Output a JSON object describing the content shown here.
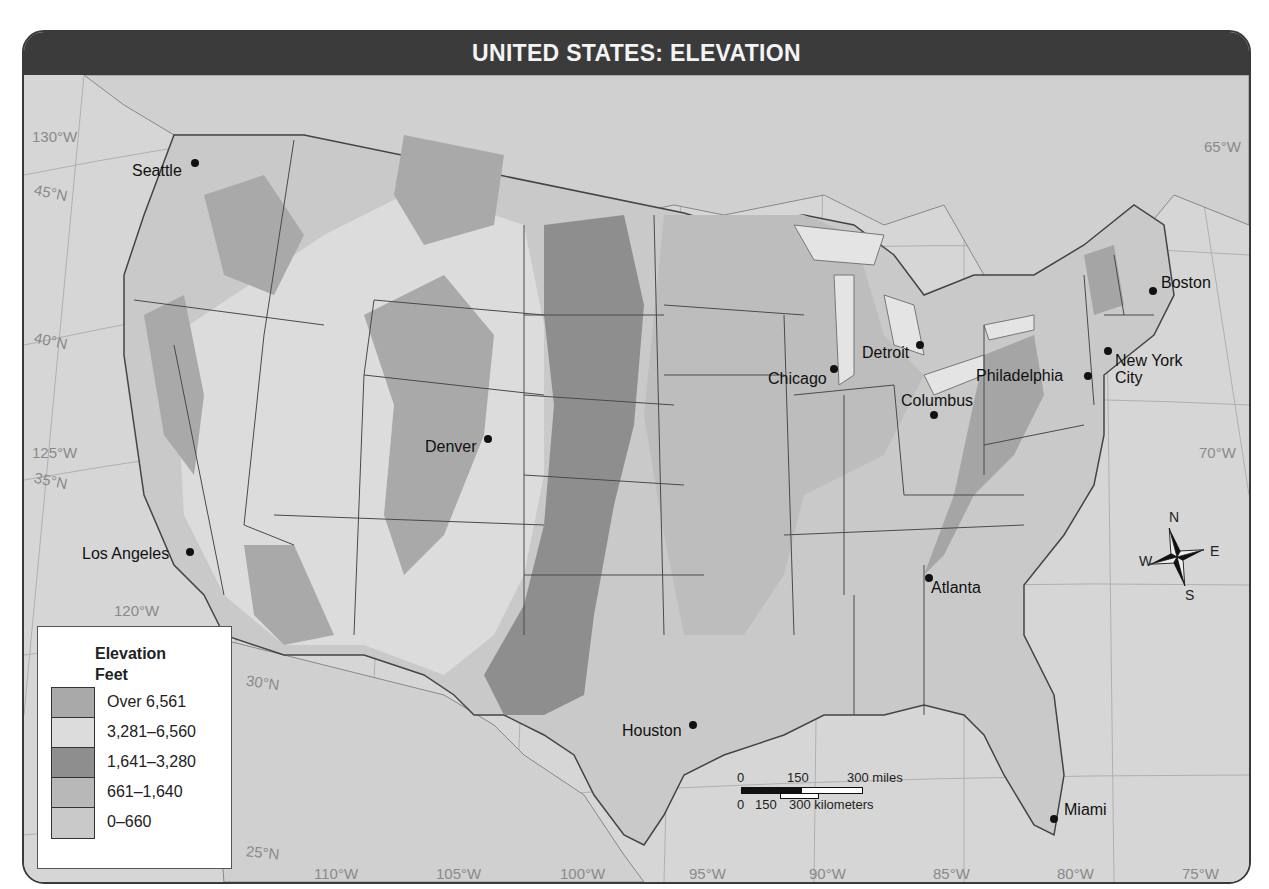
{
  "title": "UNITED STATES: ELEVATION",
  "legend": {
    "title": "Elevation",
    "unit": "Feet",
    "items": [
      {
        "label": "Over 6,561",
        "color": "#a9a9a9"
      },
      {
        "label": "3,281–6,560",
        "color": "#dcdcdc"
      },
      {
        "label": "1,641–3,280",
        "color": "#8e8e8e"
      },
      {
        "label": "661–1,640",
        "color": "#b8b8b8"
      },
      {
        "label": "0–660",
        "color": "#c9c9c9"
      }
    ]
  },
  "scale_bar": {
    "miles_labels": [
      "0",
      "150",
      "300 miles"
    ],
    "km_labels": [
      "0",
      "150",
      "300 kilometers"
    ]
  },
  "compass": {
    "n": "N",
    "s": "S",
    "e": "E",
    "w": "W"
  },
  "graticule": {
    "longitude_labels": [
      "130°W",
      "125°W",
      "120°W",
      "110°W",
      "105°W",
      "100°W",
      "95°W",
      "90°W",
      "85°W",
      "80°W",
      "75°W",
      "70°W",
      "65°W"
    ],
    "latitude_labels": [
      "45°N",
      "40°N",
      "35°N",
      "30°N",
      "25°N"
    ]
  },
  "cities": [
    {
      "name": "Seattle"
    },
    {
      "name": "Los Angeles"
    },
    {
      "name": "Denver"
    },
    {
      "name": "Houston"
    },
    {
      "name": "Chicago"
    },
    {
      "name": "Detroit"
    },
    {
      "name": "Columbus"
    },
    {
      "name": "Philadelphia"
    },
    {
      "name": "New York City"
    },
    {
      "name": "Boston"
    },
    {
      "name": "Atlanta"
    },
    {
      "name": "Miami"
    }
  ]
}
